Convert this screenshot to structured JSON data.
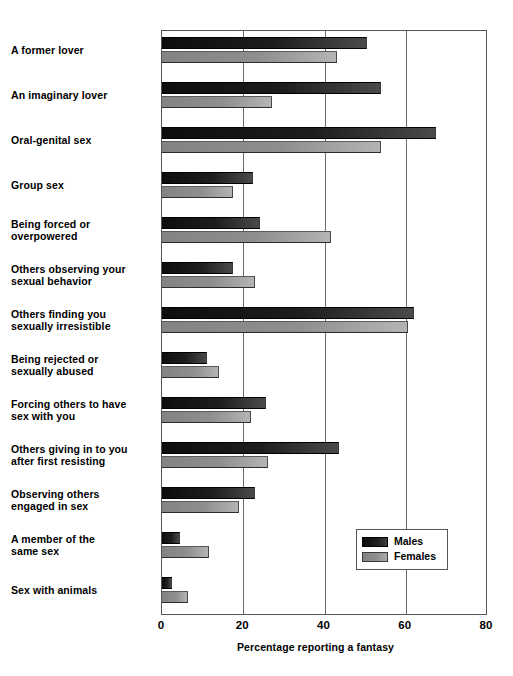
{
  "chart_data": {
    "type": "bar",
    "orientation": "horizontal",
    "title": "",
    "xlabel": "Percentage reporting a fantasy",
    "ylabel": "",
    "xlim": [
      0,
      80
    ],
    "xticks": [
      0,
      20,
      40,
      60,
      80
    ],
    "grid": true,
    "legend_position": "bottom-right",
    "categories": [
      "A former lover",
      "An imaginary lover",
      "Oral-genital sex",
      "Group sex",
      "Being forced or\noverpowered",
      "Others observing your\nsexual behavior",
      "Others finding you\nsexually irresistible",
      "Being rejected or\nsexually abused",
      "Forcing others to have\nsex  with you",
      "Others giving in to you\nafter first resisting",
      "Observing others\nengaged in sex",
      "A member of the\nsame sex",
      "Sex with animals"
    ],
    "series": [
      {
        "name": "Males",
        "color": "#141414",
        "values": [
          50.5,
          54,
          67.5,
          22.5,
          24,
          17.5,
          62,
          11,
          25.5,
          43.5,
          23,
          4.5,
          2.5
        ]
      },
      {
        "name": "Females",
        "color": "#909090",
        "values": [
          43,
          27,
          54,
          17.5,
          41.5,
          23,
          60.5,
          14,
          22,
          26,
          19,
          11.5,
          6.5
        ]
      }
    ]
  },
  "legend": {
    "items": [
      {
        "label": "Males",
        "swatch": "males-swatch"
      },
      {
        "label": "Females",
        "swatch": "females-swatch"
      }
    ]
  },
  "axis": {
    "x_title": "Percentage reporting a fantasy",
    "tick_labels": [
      "0",
      "20",
      "40",
      "60",
      "80"
    ]
  }
}
